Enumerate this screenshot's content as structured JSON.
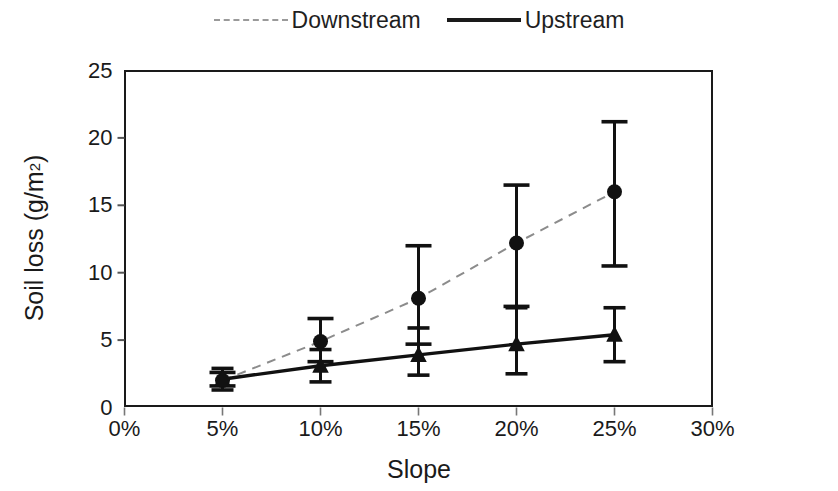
{
  "chart_data": {
    "type": "line",
    "title": "",
    "xlabel": "Slope",
    "ylabel": "Soil loss (g/m",
    "ylabel_sup": "2",
    "ylabel_suffix": ")",
    "xtick_labels": [
      "0%",
      "5%",
      "10%",
      "15%",
      "20%",
      "25%",
      "30%"
    ],
    "xtick_values": [
      0,
      5,
      10,
      15,
      20,
      25,
      30
    ],
    "ytick_labels": [
      "0",
      "5",
      "10",
      "15",
      "20",
      "25"
    ],
    "ytick_values": [
      0,
      5,
      10,
      15,
      20,
      25
    ],
    "xlim": [
      0,
      30
    ],
    "ylim": [
      0,
      25
    ],
    "grid": false,
    "legend_position": "top-center",
    "series": [
      {
        "name": "Downstream",
        "style": "dashed",
        "color": "#8c8c8c",
        "marker": "circle",
        "marker_color": "#111111",
        "x": [
          5,
          10,
          15,
          20,
          25
        ],
        "values": [
          2.0,
          4.9,
          8.1,
          12.2,
          16.0
        ],
        "err_low": [
          1.6,
          3.4,
          4.7,
          7.5,
          10.5
        ],
        "err_high": [
          2.6,
          6.6,
          12.0,
          16.5,
          21.2
        ]
      },
      {
        "name": "Upstream",
        "style": "solid",
        "color": "#111111",
        "marker": "triangle",
        "marker_color": "#111111",
        "x": [
          5,
          10,
          15,
          20,
          25
        ],
        "values": [
          2.1,
          3.1,
          3.9,
          4.7,
          5.4
        ],
        "err_low": [
          1.3,
          1.9,
          2.4,
          2.5,
          3.4
        ],
        "err_high": [
          2.9,
          4.3,
          5.9,
          7.4,
          7.4
        ]
      }
    ]
  },
  "legend": {
    "entries": [
      {
        "label": "Downstream",
        "style": "dashed"
      },
      {
        "label": "Upstream",
        "style": "solid"
      }
    ]
  }
}
